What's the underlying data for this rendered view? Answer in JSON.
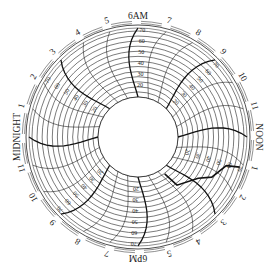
{
  "chart_data": {
    "type": "circular-chart-recorder",
    "title": "",
    "period_hours": 24,
    "orientation": "6AM at top, clockwise",
    "hour_labels": [
      "6AM",
      "7",
      "8",
      "9",
      "10",
      "11",
      "NOON",
      "1",
      "2",
      "3",
      "4",
      "5",
      "6PM",
      "7",
      "8",
      "9",
      "10",
      "11",
      "MIDNIGHT",
      "1",
      "2",
      "3",
      "4",
      "5"
    ],
    "radial_scale": {
      "min": 10,
      "max": 70,
      "ticks": [
        10,
        20,
        30,
        40,
        50,
        60,
        70
      ],
      "labels": [
        "20",
        "30",
        "40",
        "50",
        "60",
        "70"
      ],
      "label_positions_hours": [
        0,
        3,
        7,
        12,
        15,
        20
      ]
    },
    "grid": {
      "radial_rings": 13,
      "hour_arcs": 24,
      "bold_every_hours": 3
    },
    "trace": {
      "description": "Pen trace segment between ~7AM and ~9AM",
      "points": [
        {
          "hour": 7.1,
          "value": 70
        },
        {
          "hour": 7.2,
          "value": 58
        },
        {
          "hour": 7.9,
          "value": 50
        },
        {
          "hour": 8.3,
          "value": 40
        },
        {
          "hour": 9.4,
          "value": 30
        },
        {
          "hour": 9.6,
          "value": 15
        }
      ]
    }
  },
  "colors": {
    "line": "#222222",
    "bold_line": "#111111",
    "background": "#ffffff"
  }
}
